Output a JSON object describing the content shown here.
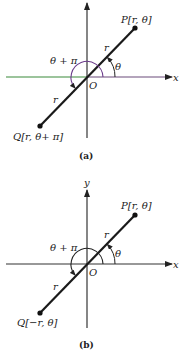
{
  "figure_a": {
    "caption": "(a)",
    "x_axis_label": "x",
    "origin_label": "O",
    "point_p_label": "P[r, θ]",
    "point_q_label": "Q[r, θ+ π]",
    "r_label_upper": "r",
    "r_label_lower": "r",
    "angle_theta_label": "θ",
    "angle_theta_pi_label": "θ + π",
    "colors": {
      "x_axis_left": "#3a8a3a",
      "x_axis_right": "#6a4a7a",
      "arc": "#6a3a8a",
      "segment": "#1a1a1a"
    }
  },
  "figure_b": {
    "caption": "(b)",
    "x_axis_label": "x",
    "y_axis_label": "y",
    "origin_label": "O",
    "point_p_label": "P[r, θ]",
    "point_q_label": "Q[−r, θ]",
    "r_label_upper": "r",
    "r_label_lower": "r",
    "angle_theta_label": "θ",
    "angle_theta_pi_label": "θ + π",
    "colors": {
      "x_axis": "#333333",
      "arc": "#222222",
      "segment": "#1a1a1a"
    }
  }
}
